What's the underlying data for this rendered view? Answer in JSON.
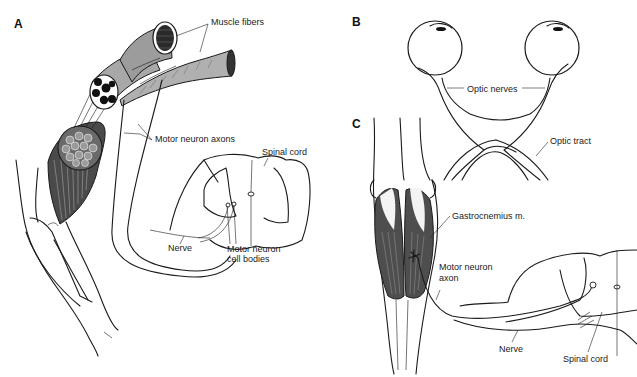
{
  "figure": {
    "panels": [
      {
        "id": "A",
        "label": "A",
        "annotations": [
          {
            "key": "muscle_fibers",
            "text": "Muscle fibers"
          },
          {
            "key": "motor_neuron_axons",
            "text": "Motor neuron axons"
          },
          {
            "key": "spinal_cord",
            "text": "Spinal cord"
          },
          {
            "key": "nerve",
            "text": "Nerve"
          },
          {
            "key": "motor_neuron_cell_bodies_1",
            "text": "Motor neuron"
          },
          {
            "key": "motor_neuron_cell_bodies_2",
            "text": "cell bodies"
          }
        ]
      },
      {
        "id": "B",
        "label": "B",
        "annotations": [
          {
            "key": "optic_nerves",
            "text": "Optic nerves"
          },
          {
            "key": "optic_tract",
            "text": "Optic tract"
          }
        ]
      },
      {
        "id": "C",
        "label": "C",
        "annotations": [
          {
            "key": "gastrocnemius",
            "text": "Gastrocnemius m."
          },
          {
            "key": "motor_neuron_axon_1",
            "text": "Motor neuron"
          },
          {
            "key": "motor_neuron_axon_2",
            "text": "axon"
          },
          {
            "key": "nerve",
            "text": "Nerve"
          },
          {
            "key": "spinal_cord",
            "text": "Spinal cord"
          }
        ]
      }
    ],
    "colors": {
      "ink": "#1a1a1a",
      "muscle_fill": "#8c8c8c",
      "muscle_dark": "#3a3a3a",
      "background": "#ffffff"
    }
  }
}
